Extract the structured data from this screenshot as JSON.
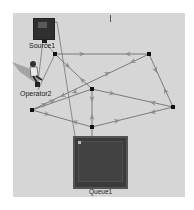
{
  "model": {
    "objects": [
      {
        "id": "source",
        "label": "Source1",
        "type": "source"
      },
      {
        "id": "operator",
        "label": "Operator2",
        "type": "operator"
      },
      {
        "id": "queue",
        "label": "Queue1",
        "type": "queue"
      }
    ],
    "network_nodes": [
      {
        "id": "A",
        "x": 55,
        "y": 54
      },
      {
        "id": "B",
        "x": 149,
        "y": 54
      },
      {
        "id": "C",
        "x": 92,
        "y": 89
      },
      {
        "id": "D",
        "x": 32,
        "y": 110
      },
      {
        "id": "E",
        "x": 173,
        "y": 107
      },
      {
        "id": "F",
        "x": 92,
        "y": 127
      }
    ],
    "colors": {
      "canvas": "#d6d6d6",
      "path": "#6e6e6e",
      "arrow": "#8a8a8a",
      "node": "#111111",
      "object": "#333333"
    }
  }
}
